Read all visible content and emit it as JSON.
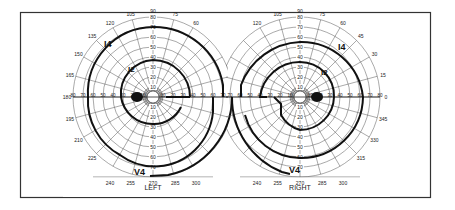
{
  "figure": {
    "type": "Goldmann visual field chart",
    "frame": {
      "x": 20,
      "y": 12,
      "width": 410,
      "height": 185
    },
    "colors": {
      "background": "#ffffff",
      "grid": "#555555",
      "isopter": "#111111",
      "frame": "#333333"
    }
  },
  "fields": [
    {
      "eye": "left",
      "label": "LEFT",
      "center": [
        153,
        97
      ],
      "scale_px_per_10deg": 10,
      "meridian_labels": [
        {
          "angle": 90,
          "text": "90"
        },
        {
          "angle": 105,
          "text": "105"
        },
        {
          "angle": 120,
          "text": "120"
        },
        {
          "angle": 135,
          "text": "135"
        },
        {
          "angle": 150,
          "text": "150"
        },
        {
          "angle": 165,
          "text": "165"
        },
        {
          "angle": 180,
          "text": "180"
        },
        {
          "angle": 195,
          "text": "195"
        },
        {
          "angle": 210,
          "text": "210"
        },
        {
          "angle": 225,
          "text": "225"
        },
        {
          "angle": 240,
          "text": "240"
        },
        {
          "angle": 255,
          "text": "255"
        },
        {
          "angle": 270,
          "text": "270"
        },
        {
          "angle": 285,
          "text": "285"
        },
        {
          "angle": 300,
          "text": "300"
        },
        {
          "angle": 75,
          "text": "75"
        },
        {
          "angle": 60,
          "text": "60"
        }
      ],
      "radial_labels": [
        "10",
        "20",
        "30",
        "40",
        "50",
        "60",
        "70",
        "80"
      ],
      "isopters": [
        {
          "name": "I4",
          "label": "I4"
        },
        {
          "name": "I2",
          "label": "I2"
        },
        {
          "name": "V4",
          "label": "V4"
        }
      ],
      "blind_spot": {
        "angle": 180,
        "ecc": 15
      }
    },
    {
      "eye": "right",
      "label": "RIGHT",
      "center": [
        300,
        97
      ],
      "scale_px_per_10deg": 10,
      "meridian_labels": [
        {
          "angle": 90,
          "text": "90"
        },
        {
          "angle": 75,
          "text": "75"
        },
        {
          "angle": 60,
          "text": "60"
        },
        {
          "angle": 45,
          "text": "45"
        },
        {
          "angle": 30,
          "text": "30"
        },
        {
          "angle": 15,
          "text": "15"
        },
        {
          "angle": 0,
          "text": "0"
        },
        {
          "angle": 345,
          "text": "345"
        },
        {
          "angle": 330,
          "text": "330"
        },
        {
          "angle": 315,
          "text": "315"
        },
        {
          "angle": 300,
          "text": "300"
        },
        {
          "angle": 285,
          "text": "285"
        },
        {
          "angle": 270,
          "text": "270"
        },
        {
          "angle": 255,
          "text": "255"
        },
        {
          "angle": 240,
          "text": "240"
        },
        {
          "angle": 105,
          "text": "105"
        },
        {
          "angle": 120,
          "text": "120"
        }
      ],
      "radial_labels": [
        "10",
        "20",
        "30",
        "40",
        "50",
        "60",
        "70",
        "80"
      ],
      "isopters": [
        {
          "name": "I4",
          "label": "I4"
        },
        {
          "name": "I2",
          "label": "I2"
        },
        {
          "name": "V4",
          "label": "V4"
        }
      ],
      "blind_spot": {
        "angle": 0,
        "ecc": 15
      }
    }
  ]
}
